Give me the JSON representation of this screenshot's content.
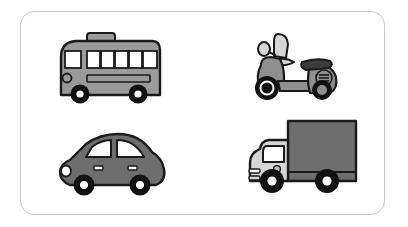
{
  "scene": {
    "title": "Vehicles illustration card",
    "background_color": "#ffffff",
    "frame": {
      "border_color": "#c9c9c9",
      "corner_radius": 14,
      "fill": "#ffffff"
    }
  },
  "palette": {
    "outline": "#1a1a1a",
    "body_mid_gray": "#9a9a9a",
    "body_dark_gray": "#6e6e6e",
    "body_light_gray": "#d6d6d6",
    "window_white": "#ffffff",
    "wheel_black": "#111111",
    "hub_white": "#ffffff",
    "seat_dark": "#3d3d3d",
    "cargo_gray": "#6e6e6e"
  },
  "vehicles": [
    {
      "id": "bus",
      "label": "Bus",
      "position": "top-left",
      "body_color": "#9a9a9a",
      "window_color": "#ffffff",
      "side_window_count": 5,
      "front_window_count": 1,
      "wheel_count": 2,
      "has_roof_hatch": true,
      "has_headlight": true,
      "has_side_stripe": true
    },
    {
      "id": "scooter",
      "label": "Scooter",
      "position": "top-right",
      "body_color": "#8f8f8f",
      "accent_color": "#d6d6d6",
      "seat_color": "#3d3d3d",
      "wheel_count": 2,
      "has_mirror": true,
      "has_windshield": true,
      "has_rear_vents": true,
      "vent_line_count": 3
    },
    {
      "id": "car",
      "label": "Car",
      "position": "bottom-left",
      "body_color": "#6e6e6e",
      "window_color": "#ffffff",
      "window_count": 2,
      "wheel_count": 2,
      "door_handle_count": 2,
      "has_headlight": true
    },
    {
      "id": "truck",
      "label": "Truck",
      "position": "bottom-right",
      "cab_color": "#d6d6d6",
      "cargo_color": "#6e6e6e",
      "window_color": "#ffffff",
      "wheel_count": 2,
      "has_cargo_box": true,
      "has_fuel_cap": true,
      "has_bumper": true
    }
  ]
}
